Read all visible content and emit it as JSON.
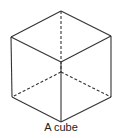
{
  "diagram": {
    "caption": "A cube",
    "stroke_color": "#333333",
    "vertices": {
      "top": [
        61,
        11
      ],
      "left_top": [
        11,
        37
      ],
      "right_top": [
        111,
        36
      ],
      "front_center": [
        61,
        62
      ],
      "left_bottom": [
        12,
        97
      ],
      "right_bottom": [
        111,
        97
      ],
      "bottom": [
        61,
        122
      ],
      "hidden_center": [
        61,
        72
      ]
    },
    "solid_edges": [
      [
        "top",
        "left_top"
      ],
      [
        "top",
        "right_top"
      ],
      [
        "left_top",
        "front_center"
      ],
      [
        "right_top",
        "front_center"
      ],
      [
        "left_top",
        "left_bottom"
      ],
      [
        "right_top",
        "right_bottom"
      ],
      [
        "front_center",
        "bottom"
      ],
      [
        "left_bottom",
        "bottom"
      ],
      [
        "right_bottom",
        "bottom"
      ]
    ],
    "hidden_edges": [
      [
        "top",
        "hidden_center"
      ],
      [
        "hidden_center",
        "left_bottom"
      ],
      [
        "hidden_center",
        "right_bottom"
      ]
    ]
  }
}
